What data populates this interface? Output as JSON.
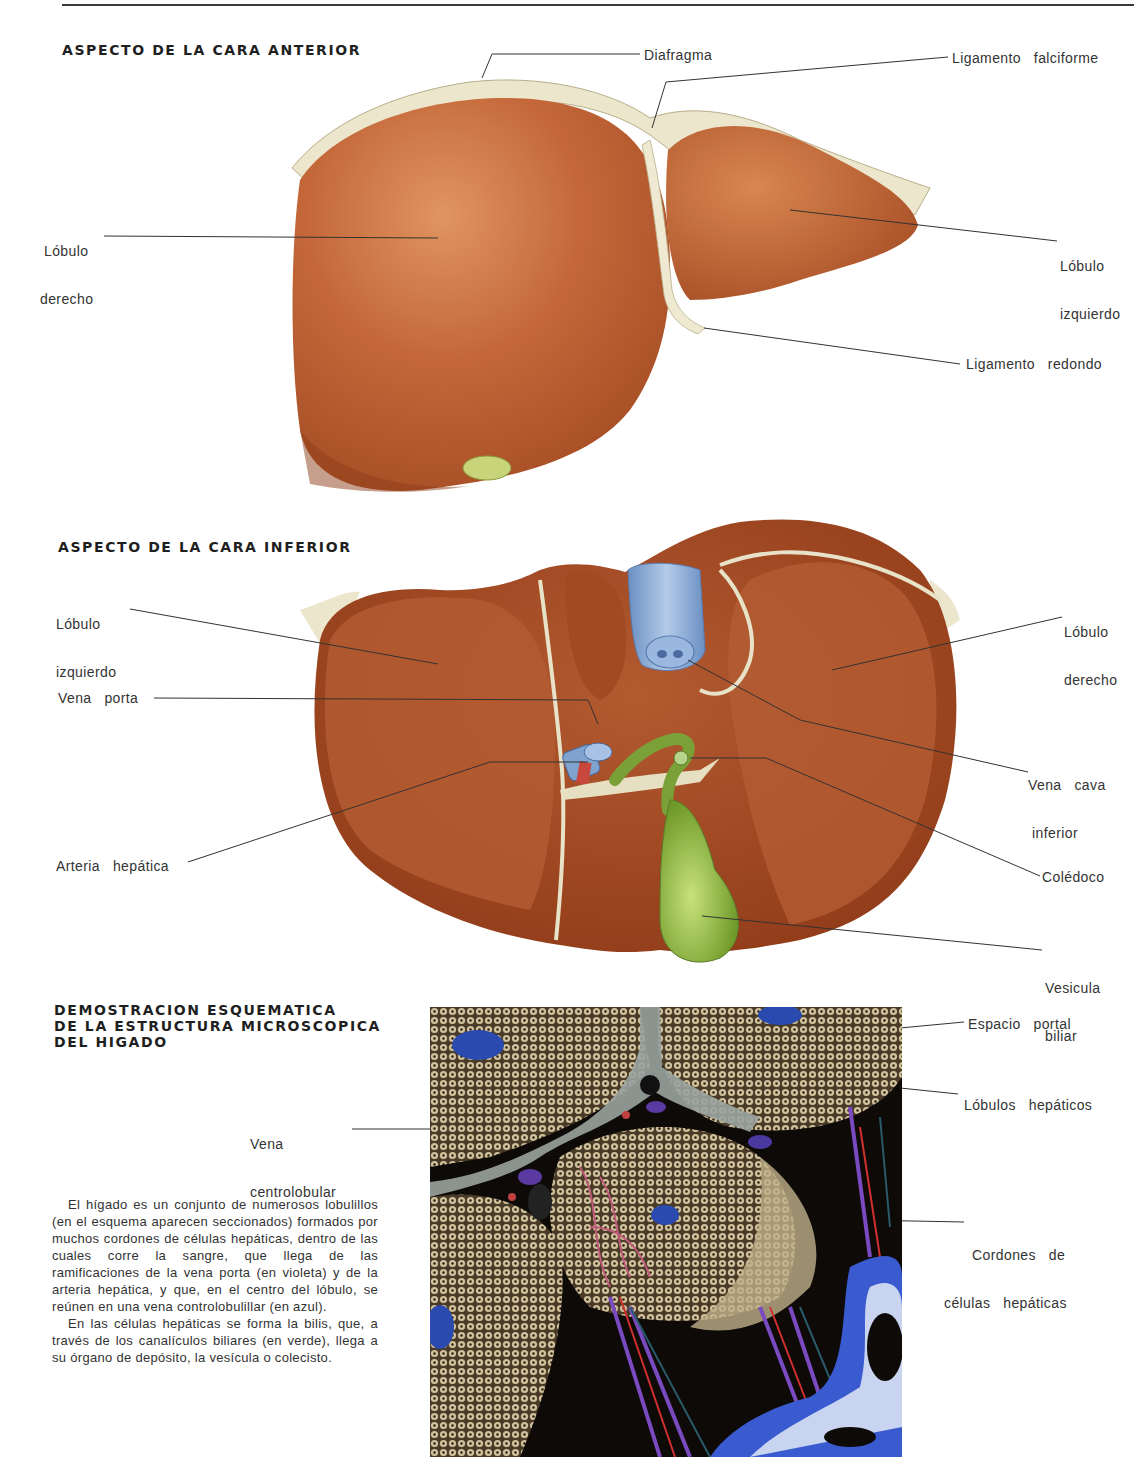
{
  "page": {
    "sections": [
      {
        "title": "ASPECTO DE LA CARA ANTERIOR",
        "labels": {
          "diafragma": "Diafragma",
          "ligamento_falciforme": "Ligamento   falciforme",
          "lobulo_derecho": [
            "Lóbulo",
            "derecho"
          ],
          "lobulo_izquierdo": [
            "Lóbulo",
            "izquierdo"
          ],
          "ligamento_redondo": "Ligamento   redondo"
        }
      },
      {
        "title": "ASPECTO DE LA CARA INFERIOR",
        "labels": {
          "lobulo_izquierdo": [
            "Lóbulo",
            "izquierdo"
          ],
          "vena_porta": "Vena   porta",
          "arteria_hepatica": "Arteria   hepática",
          "lobulo_derecho": [
            "Lóbulo",
            "derecho"
          ],
          "vena_cava": [
            "Vena   cava",
            "inferior"
          ],
          "coledoco": "Colédoco",
          "vesicula": [
            "Vesicula",
            "biliar"
          ]
        }
      },
      {
        "title": [
          "DEMOSTRACION ESQUEMATICA",
          "DE LA ESTRUCTURA MICROSCOPICA",
          "DEL HIGADO"
        ],
        "labels": {
          "vena_centrolobular": [
            "Vena",
            "centrolobular"
          ],
          "espacio_portal": "Espacio   portal",
          "lobulos_hepaticos": "Lóbulos   hepáticos",
          "cordones": [
            "Cordones   de",
            "células   hepáticas"
          ]
        },
        "paragraphs": [
          "El hígado es un conjunto de numerosos lobulillos (en el esquema aparecen seccionados) formados por muchos cordones de células hepáticas, dentro de las cuales corre la sangre, que llega de las ramificaciones de la vena porta (en violeta) y de la arteria hepática, y que, en el centro del lóbulo, se reúnen en una vena controlobulillar (en azul).",
          "En las células hepáticas se forma la bilis, que, a través de los canalículos biliares (en verde), llega a su órgano de depósito, la vesícula o colecisto."
        ]
      }
    ],
    "colors": {
      "liver": "#b8582c",
      "liver_light": "#d7834a",
      "ligament": "#e8e2c8",
      "vein_blue": "#8fb0d6",
      "gallbladder": "#8fb33a",
      "micro_bg": "#0d0a08",
      "micro_cells": "#a89a78"
    }
  }
}
